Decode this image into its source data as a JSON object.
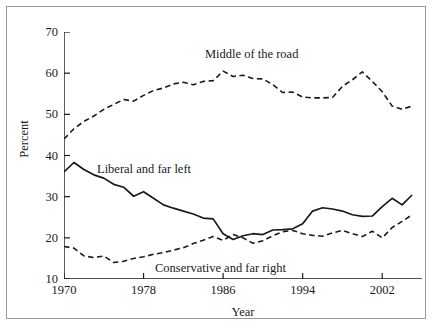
{
  "figure": {
    "background": "#ffffff",
    "frame_color": "#9a9a9a",
    "line_color": "#1a1a1a"
  },
  "axis": {
    "y_title": "Percent",
    "x_title": "Year",
    "y_ticks": [
      "70",
      "60",
      "50",
      "40",
      "30",
      "20",
      "10"
    ],
    "x_ticks": [
      "1970",
      "1978",
      "1986",
      "1994",
      "2002"
    ]
  },
  "labels": {
    "middle": "Middle of the road",
    "liberal": "Liberal and far left",
    "conservative": "Conservative and far right"
  },
  "chart_data": {
    "type": "line",
    "title": "",
    "xlabel": "Year",
    "ylabel": "Percent",
    "xlim": [
      1970,
      2006
    ],
    "ylim": [
      10,
      70
    ],
    "xticks": [
      1970,
      1978,
      1986,
      1994,
      2002
    ],
    "yticks": [
      10,
      20,
      30,
      40,
      50,
      60,
      70
    ],
    "grid": false,
    "legend": "inline-annotations",
    "x": [
      1970,
      1971,
      1972,
      1973,
      1974,
      1975,
      1976,
      1977,
      1978,
      1979,
      1980,
      1981,
      1982,
      1983,
      1984,
      1985,
      1986,
      1987,
      1988,
      1989,
      1990,
      1991,
      1992,
      1993,
      1994,
      1995,
      1996,
      1997,
      1998,
      1999,
      2000,
      2001,
      2002,
      2003,
      2004,
      2005
    ],
    "series": [
      {
        "name": "Middle of the road",
        "style": "dashed",
        "color": "#1a1a1a",
        "values": [
          44.0,
          46.5,
          48.3,
          49.6,
          51.2,
          52.4,
          53.6,
          53.2,
          54.6,
          55.8,
          56.4,
          57.4,
          57.8,
          57.2,
          58.0,
          58.2,
          60.5,
          59.2,
          59.5,
          58.7,
          58.6,
          57.2,
          55.3,
          55.4,
          54.2,
          54.0,
          54.0,
          54.1,
          56.8,
          58.4,
          60.3,
          58.0,
          55.5,
          52.0,
          51.2,
          52.0
        ]
      },
      {
        "name": "Liberal and far left",
        "style": "solid",
        "color": "#1a1a1a",
        "values": [
          36.0,
          38.3,
          36.6,
          35.3,
          34.5,
          33.0,
          32.3,
          30.1,
          31.2,
          29.6,
          28.0,
          27.2,
          26.5,
          25.8,
          24.8,
          24.6,
          21.0,
          19.6,
          20.5,
          21.0,
          20.8,
          21.9,
          22.0,
          22.2,
          23.4,
          26.5,
          27.3,
          27.0,
          26.5,
          25.6,
          25.2,
          25.3,
          27.6,
          29.6,
          28.0,
          30.4
        ]
      },
      {
        "name": "Conservative and far right",
        "style": "dashed",
        "color": "#1a1a1a",
        "values": [
          17.9,
          17.5,
          15.6,
          15.2,
          15.6,
          14.0,
          14.3,
          15.0,
          15.4,
          16.0,
          16.4,
          17.0,
          17.6,
          18.6,
          19.4,
          20.3,
          19.4,
          20.8,
          20.0,
          18.7,
          19.3,
          20.5,
          21.5,
          21.8,
          21.0,
          20.6,
          20.4,
          21.2,
          21.8,
          21.0,
          20.3,
          21.6,
          20.0,
          22.5,
          24.0,
          25.6
        ]
      }
    ]
  }
}
